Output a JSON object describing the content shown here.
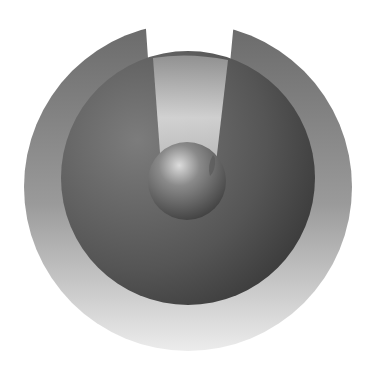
{
  "graphic": {
    "description": "abstract grayscale emblem: notched outer ring, dark inner disc, light beam and central sphere",
    "colors": {
      "background": "#ffffff",
      "outer_ring_top": "#6e6e6e",
      "outer_ring_bottom": "#e6e6e6",
      "inner_disc_light": "#7a7a7a",
      "inner_disc_dark": "#3a3a3a",
      "beam_light": "#e8e8e8",
      "sphere_highlight": "#d8d8d8",
      "sphere_shadow": "#4a4a4a"
    }
  }
}
